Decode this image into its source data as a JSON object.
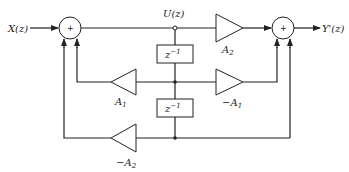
{
  "diagram": {
    "type": "block-diagram",
    "input": {
      "label": "X(z)"
    },
    "output": {
      "label": "Y'(z)"
    },
    "internal_signal": {
      "label": "U(z)"
    },
    "summers": [
      {
        "id": "left-summer",
        "symbol": "+"
      },
      {
        "id": "right-summer",
        "symbol": "+"
      }
    ],
    "delays": [
      {
        "id": "delay-1",
        "label": "z",
        "exponent": "−1"
      },
      {
        "id": "delay-2",
        "label": "z",
        "exponent": "−1"
      }
    ],
    "gains": [
      {
        "id": "gain-a2-top",
        "prefix": "",
        "name": "A",
        "sub": "2"
      },
      {
        "id": "gain-a1-feedback",
        "prefix": "",
        "name": "A",
        "sub": "1"
      },
      {
        "id": "gain-neg-a1-forward",
        "prefix": "−",
        "name": "A",
        "sub": "1"
      },
      {
        "id": "gain-neg-a2-feedback",
        "prefix": "−",
        "name": "A",
        "sub": "2"
      }
    ]
  }
}
